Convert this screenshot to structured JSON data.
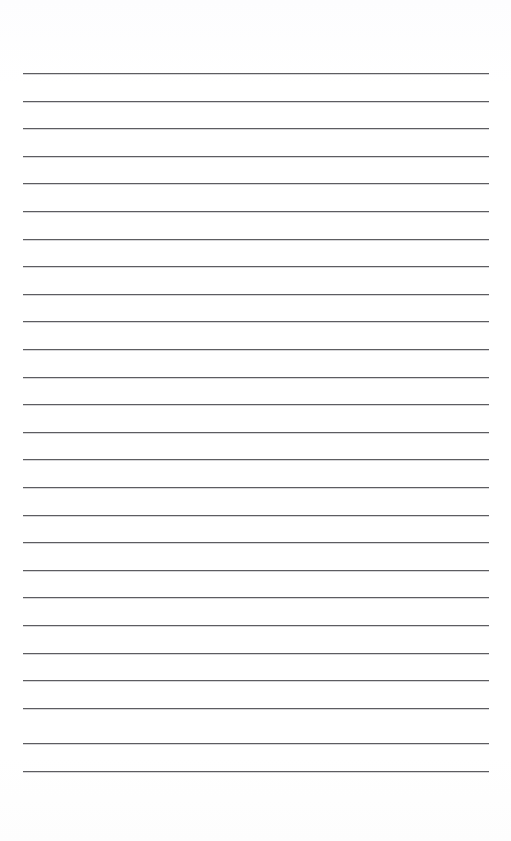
{
  "document": {
    "kind": "lined-paper",
    "title": "Blank Lined Paper",
    "description": "Scanned blank ruled writing paper with horizontal rule lines and no written content",
    "page_width": 511,
    "page_height": 841,
    "background_color": "#ffffff",
    "orientation": "portrait",
    "has_text_content": false,
    "header_text": "",
    "footer_text": "",
    "page_number_text": ""
  },
  "ruling": {
    "line_color": "#5d5d61",
    "line_thickness_px": 1,
    "line_count": 26,
    "first_line_y": 73,
    "line_spacing_px": 27.6,
    "last_line_y": 771,
    "line_left_x": 23,
    "line_right_x": 489,
    "line_length_px": 466,
    "margin_left_px": 23,
    "margin_right_px": 22,
    "top_blank_height_px": 73,
    "bottom_blank_height_px": 70,
    "has_vertical_margin_rule": false,
    "lines": [
      {
        "index": 1,
        "y": 73,
        "content": ""
      },
      {
        "index": 2,
        "y": 101,
        "content": ""
      },
      {
        "index": 3,
        "y": 128,
        "content": ""
      },
      {
        "index": 4,
        "y": 156,
        "content": ""
      },
      {
        "index": 5,
        "y": 183,
        "content": ""
      },
      {
        "index": 6,
        "y": 211,
        "content": ""
      },
      {
        "index": 7,
        "y": 239,
        "content": ""
      },
      {
        "index": 8,
        "y": 266,
        "content": ""
      },
      {
        "index": 9,
        "y": 294,
        "content": ""
      },
      {
        "index": 10,
        "y": 321,
        "content": ""
      },
      {
        "index": 11,
        "y": 349,
        "content": ""
      },
      {
        "index": 12,
        "y": 377,
        "content": ""
      },
      {
        "index": 13,
        "y": 404,
        "content": ""
      },
      {
        "index": 14,
        "y": 432,
        "content": ""
      },
      {
        "index": 15,
        "y": 459,
        "content": ""
      },
      {
        "index": 16,
        "y": 487,
        "content": ""
      },
      {
        "index": 17,
        "y": 515,
        "content": ""
      },
      {
        "index": 18,
        "y": 542,
        "content": ""
      },
      {
        "index": 19,
        "y": 570,
        "content": ""
      },
      {
        "index": 20,
        "y": 597,
        "content": ""
      },
      {
        "index": 21,
        "y": 625,
        "content": ""
      },
      {
        "index": 22,
        "y": 653,
        "content": ""
      },
      {
        "index": 23,
        "y": 680,
        "content": ""
      },
      {
        "index": 24,
        "y": 708,
        "content": ""
      },
      {
        "index": 25,
        "y": 743,
        "content": ""
      },
      {
        "index": 26,
        "y": 771,
        "content": ""
      }
    ]
  }
}
